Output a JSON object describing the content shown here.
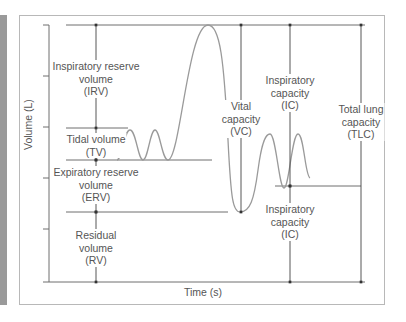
{
  "diagram": {
    "axes": {
      "y_label": "Volume (L)",
      "x_label": "Time (s)"
    },
    "volumes": [
      {
        "id": "irv",
        "lines": [
          "Inspiratory reserve",
          "volume",
          "(IRV)"
        ]
      },
      {
        "id": "tv",
        "lines": [
          "Tidal volume",
          "(TV)"
        ]
      },
      {
        "id": "erv",
        "lines": [
          "Expiratory reserve",
          "volume",
          "(ERV)"
        ]
      },
      {
        "id": "rv",
        "lines": [
          "Residual",
          "volume",
          "(RV)"
        ]
      }
    ],
    "capacities": [
      {
        "id": "vc",
        "lines": [
          "Vital",
          "capacity",
          "(VC)"
        ]
      },
      {
        "id": "ic_upper",
        "lines": [
          "Inspiratory",
          "capacity",
          "(IC)"
        ]
      },
      {
        "id": "ic_lower",
        "lines": [
          "Inspiratory",
          "capacity",
          "(IC)"
        ]
      },
      {
        "id": "tlc",
        "lines": [
          "Total lung",
          "capacity",
          "(TLC)"
        ]
      }
    ],
    "colors": {
      "axis": "#6f6f6f",
      "curve": "#9a9a9a",
      "text": "#555555",
      "sidebar": "#9a9a9a",
      "frame": "#b8b8b8"
    }
  }
}
